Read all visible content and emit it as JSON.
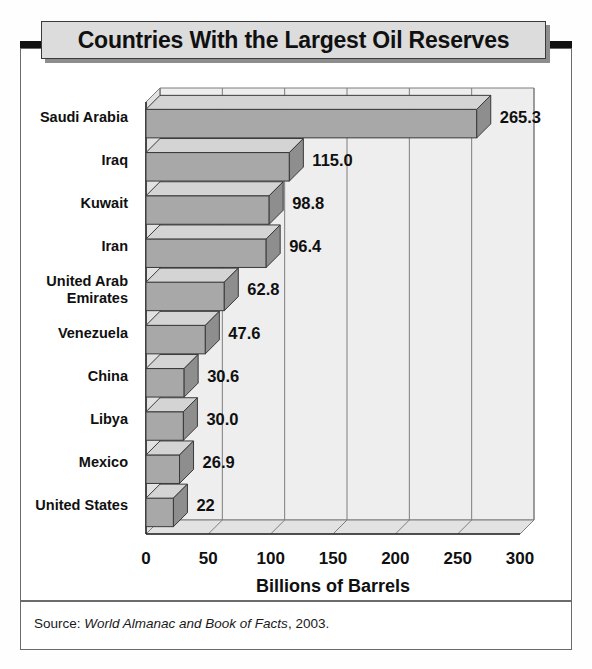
{
  "title": "Countries With the Largest Oil Reserves",
  "source": {
    "prefix": "Source: ",
    "publication": "World Almanac and Book of Facts",
    "suffix": ", 2003."
  },
  "chart_data": {
    "type": "bar",
    "orientation": "horizontal",
    "title": "Countries With the Largest Oil Reserves",
    "xlabel": "Billions of Barrels",
    "ylabel": "",
    "xlim": [
      0,
      300
    ],
    "xticks": [
      0,
      50,
      100,
      150,
      200,
      250,
      300
    ],
    "xticklabels": [
      "0",
      "50",
      "100",
      "150",
      "200",
      "250",
      "300"
    ],
    "grid": true,
    "legend": false,
    "style": "3d-isometric",
    "categories": [
      "Saudi Arabia",
      "Iraq",
      "Kuwait",
      "Iran",
      "United Arab Emirates",
      "Venezuela",
      "China",
      "Libya",
      "Mexico",
      "United States"
    ],
    "category_lines": [
      [
        "Saudi Arabia"
      ],
      [
        "Iraq"
      ],
      [
        "Kuwait"
      ],
      [
        "Iran"
      ],
      [
        "United Arab",
        "Emirates"
      ],
      [
        "Venezuela"
      ],
      [
        "China"
      ],
      [
        "Libya"
      ],
      [
        "Mexico"
      ],
      [
        "United States"
      ]
    ],
    "values": [
      265.3,
      115.0,
      98.8,
      96.4,
      62.8,
      47.6,
      30.6,
      30.0,
      26.9,
      22
    ],
    "value_labels": [
      "265.3",
      "115.0",
      "98.8",
      "96.4",
      "62.8",
      "47.6",
      "30.6",
      "30.0",
      "26.9",
      "22"
    ],
    "colors": {
      "bar_front": "#a8a8a8",
      "bar_top": "#d4d4d4",
      "bar_side": "#8e8e8e",
      "bar_outline": "#3a3a3a",
      "plot_background": "#eeeeee",
      "floor": "#e2e2e2",
      "gridline": "#7d7d7d",
      "text": "#101010",
      "title_background": "#dcdcdc",
      "frame": "#6b6b6b"
    }
  }
}
